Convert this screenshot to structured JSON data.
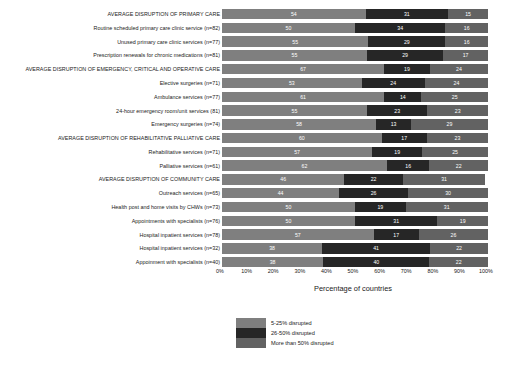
{
  "chart_data": {
    "type": "bar",
    "subtype": "stacked-horizontal-100pct",
    "title": "",
    "xlabel": "Percentage of countries",
    "ylabel": "",
    "xlim": [
      0,
      100
    ],
    "xticks": [
      "0%",
      "10%",
      "20%",
      "30%",
      "40%",
      "50%",
      "60%",
      "70%",
      "80%",
      "90%",
      "100%"
    ],
    "grid": false,
    "legend_position": "bottom-center",
    "legend": [
      "5-25% disrupted",
      "26-50% disrupted",
      "More than 50% disrupted"
    ],
    "series": [
      {
        "name": "5-25% disrupted",
        "color": "#7f7f7f",
        "values": [
          54,
          50,
          55,
          55,
          67,
          53,
          61,
          55,
          58,
          60,
          57,
          62,
          46,
          44,
          50,
          50,
          57,
          38,
          38
        ]
      },
      {
        "name": "26-50% disrupted",
        "color": "#262626",
        "values": [
          31,
          34,
          29,
          29,
          19,
          24,
          14,
          23,
          13,
          17,
          19,
          16,
          22,
          26,
          19,
          31,
          17,
          41,
          40
        ]
      },
      {
        "name": "More than 50% disrupted",
        "color": "#626262",
        "values": [
          15,
          16,
          16,
          17,
          24,
          24,
          25,
          23,
          29,
          23,
          25,
          22,
          31,
          30,
          31,
          19,
          26,
          22,
          22
        ]
      }
    ],
    "categories": [
      "AVERAGE DISRUPTION OF PRIMARY CARE",
      "Routine scheduled primary care clinic service (n=82)",
      "Unused primary care clinic services (n=77)",
      "Prescription renewals for chronic medications (n=81)",
      "AVERAGE DISRUPTION OF EMERGENCY, CRITICAL AND OPERATIVE CARE",
      "Elective surgeries (n=71)",
      "Ambulance services (n=77)",
      "24-hour emergency room/unit services (81)",
      "Emergency surgeries (n=74)",
      "AVERAGE DISRUPTION OF REHABILITATIVE PALLIATIVE CARE",
      "Rehabilitative services (n=71)",
      "Palliative services (n=61)",
      "AVERAGE DISRUPTION OF COMMUNITY CARE",
      "Outreach services (n=65)",
      "Health post and home visits by CHWs (n=73)",
      "Appointments with specialists (n=76)",
      "Hospital inpatient services (n=78)",
      "Hospital inpatient services (n=32)",
      "Appoinment with specialists (n=40)"
    ]
  }
}
